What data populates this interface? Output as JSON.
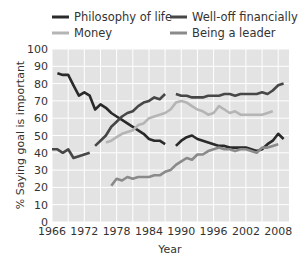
{
  "chart_data": {
    "type": "line",
    "title": "",
    "xlabel": "Year",
    "ylabel": "% Saying goal is important",
    "xlim": [
      1966,
      2010
    ],
    "ylim": [
      0,
      100
    ],
    "x_ticks": [
      1966,
      1972,
      1978,
      1984,
      1990,
      1996,
      2002,
      2008
    ],
    "y_ticks": [
      0,
      10,
      20,
      30,
      40,
      50,
      60,
      70,
      80,
      90,
      100
    ],
    "grid": true,
    "legend_position": "top",
    "legend": [
      "Philosophy of life",
      "Well-off financially",
      "Money",
      "Being a leader"
    ],
    "series": [
      {
        "name": "Philosophy of life",
        "color": "#2a2a2a",
        "segments": [
          [
            [
              1967,
              86
            ],
            [
              1968,
              85
            ],
            [
              1969,
              85
            ],
            [
              1970,
              79
            ],
            [
              1971,
              73
            ],
            [
              1972,
              75
            ],
            [
              1973,
              73
            ],
            [
              1974,
              65
            ],
            [
              1975,
              68
            ],
            [
              1976,
              66
            ],
            [
              1977,
              63
            ],
            [
              1978,
              61
            ],
            [
              1979,
              59
            ],
            [
              1980,
              57
            ],
            [
              1981,
              55
            ],
            [
              1982,
              53
            ],
            [
              1983,
              51
            ],
            [
              1984,
              48
            ],
            [
              1985,
              47
            ],
            [
              1986,
              47
            ],
            [
              1987,
              45
            ]
          ],
          [
            [
              1989,
              44
            ],
            [
              1990,
              47
            ],
            [
              1991,
              49
            ],
            [
              1992,
              50
            ],
            [
              1993,
              48
            ],
            [
              1994,
              47
            ],
            [
              1995,
              46
            ],
            [
              1996,
              45
            ],
            [
              1997,
              44
            ],
            [
              1998,
              44
            ],
            [
              1999,
              43
            ],
            [
              2000,
              43
            ],
            [
              2001,
              43
            ],
            [
              2002,
              43
            ],
            [
              2003,
              42
            ],
            [
              2004,
              41
            ],
            [
              2005,
              42
            ],
            [
              2006,
              45
            ],
            [
              2007,
              47
            ],
            [
              2008,
              51
            ],
            [
              2009,
              48
            ]
          ]
        ]
      },
      {
        "name": "Well-off financially",
        "color": "#474747",
        "segments": [
          [
            [
              1966,
              42
            ],
            [
              1967,
              42
            ],
            [
              1968,
              40
            ],
            [
              1969,
              42
            ],
            [
              1970,
              37
            ],
            [
              1971,
              38
            ],
            [
              1972,
              39
            ],
            [
              1973,
              40
            ]
          ],
          [
            [
              1974,
              44
            ],
            [
              1975,
              47
            ],
            [
              1976,
              50
            ],
            [
              1977,
              55
            ],
            [
              1978,
              58
            ],
            [
              1979,
              61
            ],
            [
              1980,
              63
            ],
            [
              1981,
              64
            ],
            [
              1982,
              67
            ],
            [
              1983,
              69
            ],
            [
              1984,
              70
            ],
            [
              1985,
              72
            ],
            [
              1986,
              71
            ],
            [
              1987,
              74
            ]
          ],
          [
            [
              1989,
              74
            ],
            [
              1990,
              73
            ],
            [
              1991,
              73
            ],
            [
              1992,
              72
            ],
            [
              1993,
              72
            ],
            [
              1994,
              72
            ],
            [
              1995,
              73
            ],
            [
              1996,
              73
            ],
            [
              1997,
              73
            ],
            [
              1998,
              74
            ],
            [
              1999,
              74
            ],
            [
              2000,
              73
            ],
            [
              2001,
              74
            ],
            [
              2002,
              74
            ],
            [
              2003,
              74
            ],
            [
              2004,
              74
            ],
            [
              2005,
              75
            ],
            [
              2006,
              74
            ],
            [
              2007,
              76
            ],
            [
              2008,
              79
            ],
            [
              2009,
              80
            ]
          ]
        ]
      },
      {
        "name": "Money",
        "color": "#b5b5b5",
        "segments": [
          [
            [
              1976,
              46
            ],
            [
              1977,
              47
            ],
            [
              1978,
              49
            ],
            [
              1979,
              51
            ],
            [
              1980,
              52
            ],
            [
              1981,
              53
            ],
            [
              1982,
              56
            ],
            [
              1983,
              57
            ],
            [
              1984,
              60
            ],
            [
              1985,
              61
            ],
            [
              1986,
              62
            ],
            [
              1987,
              63
            ],
            [
              1988,
              65
            ],
            [
              1989,
              69
            ],
            [
              1990,
              70
            ],
            [
              1991,
              69
            ],
            [
              1992,
              67
            ],
            [
              1993,
              65
            ],
            [
              1994,
              64
            ],
            [
              1995,
              62
            ],
            [
              1996,
              63
            ],
            [
              1997,
              67
            ],
            [
              1998,
              65
            ],
            [
              1999,
              63
            ],
            [
              2000,
              64
            ],
            [
              2001,
              62
            ],
            [
              2002,
              62
            ],
            [
              2003,
              62
            ],
            [
              2004,
              62
            ],
            [
              2005,
              62
            ],
            [
              2006,
              63
            ],
            [
              2007,
              64
            ]
          ]
        ]
      },
      {
        "name": "Being a leader",
        "color": "#8a8a8a",
        "segments": [
          [
            [
              1977,
              21
            ],
            [
              1978,
              25
            ],
            [
              1979,
              24
            ],
            [
              1980,
              26
            ],
            [
              1981,
              25
            ],
            [
              1982,
              26
            ],
            [
              1983,
              26
            ],
            [
              1984,
              26
            ],
            [
              1985,
              27
            ],
            [
              1986,
              27
            ],
            [
              1987,
              29
            ],
            [
              1988,
              30
            ],
            [
              1989,
              33
            ],
            [
              1990,
              35
            ],
            [
              1991,
              37
            ],
            [
              1992,
              36
            ],
            [
              1993,
              39
            ],
            [
              1994,
              39
            ],
            [
              1995,
              41
            ],
            [
              1996,
              42
            ],
            [
              1997,
              43
            ],
            [
              1998,
              42
            ],
            [
              1999,
              42
            ],
            [
              2000,
              41
            ],
            [
              2001,
              42
            ],
            [
              2002,
              42
            ],
            [
              2003,
              41
            ],
            [
              2004,
              40
            ],
            [
              2005,
              43
            ],
            [
              2006,
              43
            ],
            [
              2007,
              44
            ],
            [
              2008,
              45
            ]
          ]
        ]
      }
    ]
  },
  "legend": {
    "items": [
      {
        "label": "Philosophy of life",
        "color": "#2a2a2a"
      },
      {
        "label": "Well-off financially",
        "color": "#474747"
      },
      {
        "label": "Money",
        "color": "#b5b5b5"
      },
      {
        "label": "Being a leader",
        "color": "#8a8a8a"
      }
    ]
  },
  "axes": {
    "x_label": "Year",
    "y_label": "% Saying goal is important"
  },
  "colors": {
    "plot_bg": "#e3e3e3",
    "grid": "#ffffff"
  }
}
